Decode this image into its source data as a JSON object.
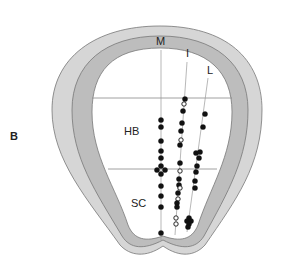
{
  "figure": {
    "panel_label": "B",
    "regions": {
      "hindbrain": "HB",
      "spinal_cord": "SC"
    },
    "columns": {
      "medial": "M",
      "intermediate": "I",
      "lateral": "L"
    },
    "colors": {
      "outer_layer": "#d4d4d4",
      "inner_layer": "#bcbcbc",
      "lumen": "#ffffff",
      "outline": "#777777",
      "lines": "#888888",
      "dots": "#111111"
    },
    "legend_note": "filled circle = cell, open circle = cell (alternate type)",
    "points": {
      "M": [
        {
          "x": 161,
          "y": 120,
          "filled": true
        },
        {
          "x": 161,
          "y": 127,
          "filled": true
        },
        {
          "x": 161,
          "y": 141,
          "filled": true
        },
        {
          "x": 161,
          "y": 151,
          "filled": true
        },
        {
          "x": 161,
          "y": 158,
          "filled": true
        },
        {
          "x": 161,
          "y": 166,
          "filled": true
        },
        {
          "x": 157,
          "y": 170,
          "filled": true
        },
        {
          "x": 165,
          "y": 170,
          "filled": true
        },
        {
          "x": 161,
          "y": 174,
          "filled": true
        },
        {
          "x": 161,
          "y": 186,
          "filled": true
        },
        {
          "x": 161,
          "y": 196,
          "filled": true
        },
        {
          "x": 161,
          "y": 207,
          "filled": true
        },
        {
          "x": 161,
          "y": 233,
          "filled": true
        }
      ],
      "I": [
        {
          "x": 185,
          "y": 99,
          "filled": true
        },
        {
          "x": 184,
          "y": 104,
          "filled": false
        },
        {
          "x": 183,
          "y": 111,
          "filled": true
        },
        {
          "x": 182,
          "y": 123,
          "filled": true
        },
        {
          "x": 181,
          "y": 131,
          "filled": true
        },
        {
          "x": 181,
          "y": 140,
          "filled": false
        },
        {
          "x": 180,
          "y": 145,
          "filled": true
        },
        {
          "x": 180,
          "y": 163,
          "filled": true
        },
        {
          "x": 180,
          "y": 171,
          "filled": false
        },
        {
          "x": 179,
          "y": 179,
          "filled": true
        },
        {
          "x": 179,
          "y": 185,
          "filled": true
        },
        {
          "x": 180,
          "y": 188,
          "filled": false
        },
        {
          "x": 178,
          "y": 193,
          "filled": true
        },
        {
          "x": 178,
          "y": 199,
          "filled": false
        },
        {
          "x": 177,
          "y": 203,
          "filled": true
        },
        {
          "x": 177,
          "y": 207,
          "filled": true
        },
        {
          "x": 176,
          "y": 218,
          "filled": false
        },
        {
          "x": 176,
          "y": 224,
          "filled": false
        }
      ],
      "L": [
        {
          "x": 205,
          "y": 114,
          "filled": true
        },
        {
          "x": 203,
          "y": 127,
          "filled": true
        },
        {
          "x": 196,
          "y": 153,
          "filled": true
        },
        {
          "x": 200,
          "y": 152,
          "filled": true
        },
        {
          "x": 199,
          "y": 158,
          "filled": true
        },
        {
          "x": 197,
          "y": 166,
          "filled": true
        },
        {
          "x": 196,
          "y": 172,
          "filled": true
        },
        {
          "x": 195,
          "y": 181,
          "filled": true
        },
        {
          "x": 195,
          "y": 188,
          "filled": true
        },
        {
          "x": 189,
          "y": 218,
          "filled": true
        },
        {
          "x": 187,
          "y": 221,
          "filled": true
        },
        {
          "x": 191,
          "y": 221,
          "filled": true
        },
        {
          "x": 189,
          "y": 224,
          "filled": true
        },
        {
          "x": 188,
          "y": 227,
          "filled": true
        }
      ]
    }
  }
}
